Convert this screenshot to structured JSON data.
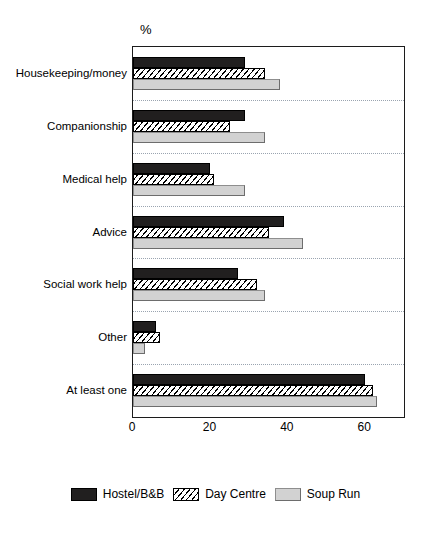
{
  "chart": {
    "axis_unit_label": "%",
    "x_ticks": [
      "0",
      "20",
      "40",
      "60"
    ]
  },
  "legend": {
    "items": [
      {
        "label": "Hostel/B&B",
        "swatch": "solid-black-swatch",
        "color": "#211f1f"
      },
      {
        "label": "Day Centre",
        "swatch": "diagonal-hatch-swatch",
        "color": "#ffffff"
      },
      {
        "label": "Soup Run",
        "swatch": "light-gray-swatch",
        "color": "#d2d2d2"
      }
    ]
  },
  "chart_data": {
    "type": "bar",
    "orientation": "horizontal",
    "title": "",
    "subtitle": "",
    "xlabel": "%",
    "ylabel": "",
    "xlim": [
      0,
      70
    ],
    "xticks": [
      0,
      20,
      40,
      60
    ],
    "grid": "dotted horizontal separators between category groups",
    "legend_position": "bottom-center",
    "categories": [
      "Housekeeping/money",
      "Companionship",
      "Medical help",
      "Advice",
      "Social work help",
      "Other",
      "At least one"
    ],
    "series": [
      {
        "name": "Hostel/B&B",
        "values": [
          29,
          29,
          20,
          39,
          27,
          6,
          60
        ]
      },
      {
        "name": "Day Centre",
        "values": [
          34,
          25,
          21,
          35,
          32,
          7,
          62
        ]
      },
      {
        "name": "Soup Run",
        "values": [
          38,
          34,
          29,
          44,
          34,
          3,
          63
        ]
      }
    ]
  }
}
